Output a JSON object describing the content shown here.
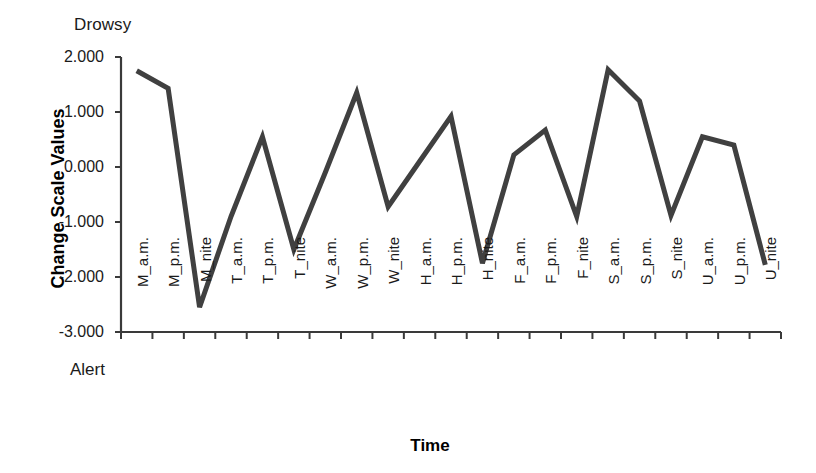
{
  "chart_data": {
    "type": "line",
    "title": "",
    "xlabel": "Time",
    "ylabel": "Change Scale Values",
    "ylim": [
      -3.0,
      2.0
    ],
    "yticks": [
      "2.000",
      "1.000",
      "0.000",
      "-1.000",
      "-2.000",
      "-3.000"
    ],
    "ytick_values": [
      2.0,
      1.0,
      0.0,
      -1.0,
      -2.0,
      -3.0
    ],
    "grid": false,
    "legend": "none",
    "line_color": "#404040",
    "line_width": 5,
    "annotations": {
      "top_axis_label": "Drowsy",
      "bottom_axis_label": "Alert"
    },
    "categories": [
      "M_a.m.",
      "M_p.m.",
      "M_nite",
      "T_a.m.",
      "T_p.m.",
      "T_nite",
      "W_a.m.",
      "W_p.m.",
      "W_nite",
      "H_a.m.",
      "H_p.m.",
      "H_nite",
      "F_a.m.",
      "F_p.m.",
      "F_nite",
      "S_a.m.",
      "S_p.m.",
      "S_nite",
      "U_a.m.",
      "U_p.m.",
      "U_nite"
    ],
    "values": [
      1.75,
      1.43,
      -2.55,
      -0.9,
      0.55,
      -1.5,
      -0.1,
      1.35,
      -0.72,
      0.1,
      0.92,
      -1.75,
      0.22,
      0.67,
      -0.9,
      1.77,
      1.2,
      -0.88,
      0.55,
      0.4,
      -1.78
    ],
    "series": [
      {
        "name": "Change Scale Values",
        "values": [
          1.75,
          1.43,
          -2.55,
          -0.9,
          0.55,
          -1.5,
          -0.1,
          1.35,
          -0.72,
          0.1,
          0.92,
          -1.75,
          0.22,
          0.67,
          -0.9,
          1.77,
          1.2,
          -0.88,
          0.55,
          0.4,
          -1.78
        ]
      }
    ]
  }
}
